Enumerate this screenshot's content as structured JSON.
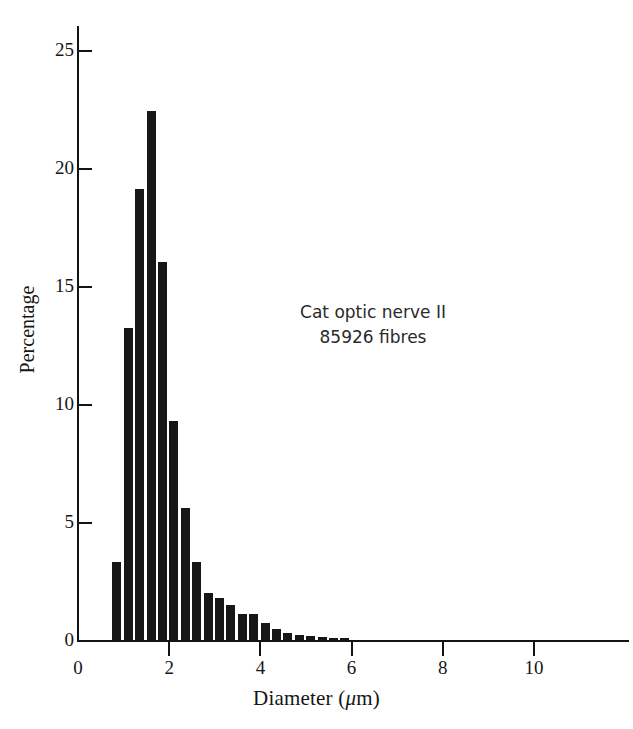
{
  "chart_data": {
    "type": "bar",
    "title": "",
    "subtitle": "",
    "xlabel": "Diameter (μm)",
    "ylabel": "Percentage",
    "xlim": [
      0,
      12.15
    ],
    "ylim": [
      0,
      26.2
    ],
    "grid": false,
    "legend": null,
    "bin_width": 0.25,
    "x_start": 0.75,
    "annotations": [
      "Cat optic nerve II",
      "85926 fibres"
    ],
    "xticks": [
      0,
      2,
      4,
      6,
      8,
      10
    ],
    "xtick_labels": [
      "0",
      "2",
      "4",
      "6",
      "8",
      "10"
    ],
    "yticks": [
      0,
      5,
      10,
      15,
      20,
      25
    ],
    "ytick_labels": [
      "0",
      "5",
      "10",
      "15",
      "20",
      "25"
    ],
    "bar_color": "#171717",
    "axis_color": "#141414",
    "categories": [
      "0.75-1.0",
      "1.0-1.25",
      "1.25-1.5",
      "1.5-1.75",
      "1.75-2.0",
      "2.0-2.25",
      "2.25-2.5",
      "2.5-2.75",
      "2.75-3.0",
      "3.0-3.25",
      "3.25-3.5",
      "3.5-3.75",
      "3.75-4.0",
      "4.0-4.25",
      "4.25-4.5",
      "4.5-4.75",
      "4.75-5.0",
      "5.0-5.25",
      "5.25-5.5",
      "5.5-5.75",
      "5.75-6.0"
    ],
    "x": [
      0.875,
      1.375,
      1.875,
      2.375,
      2.875,
      3.375,
      3.875,
      4.375,
      4.875,
      5.375,
      5.875,
      6.375,
      6.875,
      7.375,
      7.875,
      8.375,
      8.875,
      9.375,
      9.875,
      10.5,
      11.3
    ],
    "values": [
      3.3,
      13.2,
      19.1,
      22.4,
      16.0,
      9.3,
      5.6,
      3.3,
      2.0,
      1.8,
      1.5,
      1.1,
      1.1,
      0.7,
      0.45,
      0.3,
      0.2,
      0.15,
      0.12,
      0.1,
      0.08
    ],
    "bars": [
      {
        "x0": 0.75,
        "x1": 1.0,
        "value": 3.3
      },
      {
        "x0": 1.0,
        "x1": 1.25,
        "value": 13.2
      },
      {
        "x0": 1.25,
        "x1": 1.5,
        "value": 19.1
      },
      {
        "x0": 1.5,
        "x1": 1.75,
        "value": 22.4
      },
      {
        "x0": 1.75,
        "x1": 2.0,
        "value": 16.0
      },
      {
        "x0": 2.0,
        "x1": 2.25,
        "value": 9.3
      },
      {
        "x0": 2.25,
        "x1": 2.5,
        "value": 5.6
      },
      {
        "x0": 2.5,
        "x1": 2.75,
        "value": 3.3
      },
      {
        "x0": 2.75,
        "x1": 3.0,
        "value": 2.0
      },
      {
        "x0": 3.0,
        "x1": 3.25,
        "value": 1.8
      },
      {
        "x0": 3.25,
        "x1": 3.5,
        "value": 1.5
      },
      {
        "x0": 3.5,
        "x1": 3.75,
        "value": 1.1
      },
      {
        "x0": 3.75,
        "x1": 4.0,
        "value": 1.1
      },
      {
        "x0": 4.0,
        "x1": 4.25,
        "value": 0.7
      },
      {
        "x0": 4.25,
        "x1": 4.5,
        "value": 0.45
      },
      {
        "x0": 4.5,
        "x1": 4.75,
        "value": 0.3
      },
      {
        "x0": 4.75,
        "x1": 5.0,
        "value": 0.2
      },
      {
        "x0": 5.0,
        "x1": 5.25,
        "value": 0.15
      },
      {
        "x0": 5.25,
        "x1": 5.5,
        "value": 0.12
      },
      {
        "x0": 5.5,
        "x1": 5.75,
        "value": 0.1
      },
      {
        "x0": 5.75,
        "x1": 6.0,
        "value": 0.08
      }
    ]
  }
}
